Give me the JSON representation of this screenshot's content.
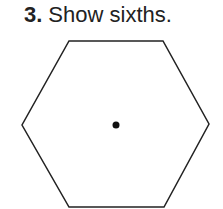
{
  "problem": {
    "number": "3.",
    "instruction": "Show sixths."
  },
  "figure": {
    "shape": "hexagon",
    "center_mark": "dot",
    "stroke_color": "#222222",
    "dot_color": "#111111"
  }
}
